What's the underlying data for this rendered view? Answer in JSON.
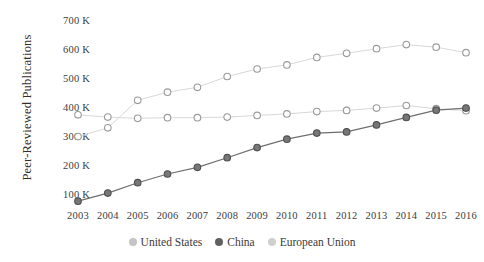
{
  "chart_data": {
    "type": "line",
    "title": "",
    "xlabel": "",
    "ylabel": "Peer-Reviewed Publications",
    "x": [
      2003,
      2004,
      2005,
      2006,
      2007,
      2008,
      2009,
      2010,
      2011,
      2012,
      2013,
      2014,
      2015,
      2016
    ],
    "categories": [
      "2003",
      "2004",
      "2005",
      "2006",
      "2007",
      "2008",
      "2009",
      "2010",
      "2011",
      "2012",
      "2013",
      "2014",
      "2015",
      "2016"
    ],
    "ylim": [
      50000,
      700000
    ],
    "yticks": [
      100000,
      200000,
      300000,
      400000,
      500000,
      600000,
      700000
    ],
    "ytick_labels": [
      "100 K",
      "200 K",
      "300 K",
      "400 K",
      "500 K",
      "600 K",
      "700 K"
    ],
    "grid": false,
    "legend_position": "bottom",
    "series": [
      {
        "name": "United States",
        "color": "#b9b9b9",
        "marker": "open-circle",
        "values": [
          380000,
          372000,
          368000,
          370000,
          370000,
          372000,
          378000,
          383000,
          391000,
          395000,
          403000,
          412000,
          401000,
          394000
        ]
      },
      {
        "name": "China",
        "color": "#5e5e5e",
        "marker": "filled-circle",
        "values": [
          82000,
          110000,
          146000,
          176000,
          199000,
          232000,
          267000,
          296000,
          317000,
          321000,
          345000,
          371000,
          396000,
          403000
        ]
      },
      {
        "name": "European Union",
        "color": "#c6c6c6",
        "marker": "open-circle",
        "values": [
          305000,
          335000,
          430000,
          458000,
          475000,
          512000,
          538000,
          552000,
          578000,
          592000,
          608000,
          622000,
          613000,
          594000
        ]
      }
    ]
  },
  "legend": {
    "items": [
      {
        "label": "United States",
        "color": "#c4c4c4"
      },
      {
        "label": "China",
        "color": "#606060"
      },
      {
        "label": "European Union",
        "color": "#cfcfcf"
      }
    ]
  }
}
